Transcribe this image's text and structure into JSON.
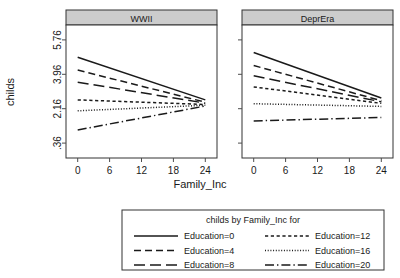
{
  "chart_data": {
    "type": "line",
    "title": "",
    "xlabel": "Family_Inc",
    "ylabel": "childs",
    "xlim": [
      -2.2,
      26.2
    ],
    "ylim": [
      -0.42,
      6.54
    ],
    "xticks": [
      0,
      6,
      12,
      18,
      24
    ],
    "xticklabels": [
      "0",
      "6",
      "12",
      "18",
      "24"
    ],
    "yticks": [
      0.36,
      2.16,
      3.96,
      5.76
    ],
    "yticklabels": [
      ".36",
      "2.16",
      "3.96",
      "5.76"
    ],
    "grid": false,
    "legend_position": "bottom",
    "legend_title": "childs by Family_Inc for",
    "panel_variable": "cohort",
    "panels": [
      {
        "label": "WWII",
        "x": [
          0,
          24
        ],
        "series": [
          {
            "name": "Education=0",
            "linestyle": "solid",
            "values": [
              4.85,
              2.62
            ]
          },
          {
            "name": "Education=4",
            "linestyle": "dashed",
            "values": [
              4.18,
              2.5
            ]
          },
          {
            "name": "Education=8",
            "linestyle": "longdash",
            "values": [
              3.55,
              2.45
            ]
          },
          {
            "name": "Education=12",
            "linestyle": "dotted",
            "values": [
              2.62,
              2.38
            ]
          },
          {
            "name": "Education=16",
            "linestyle": "finedotted",
            "values": [
              2.05,
              2.34
            ]
          },
          {
            "name": "Education=20",
            "linestyle": "dashdot",
            "values": [
              1.05,
              2.3
            ]
          }
        ]
      },
      {
        "label": "DeprEra",
        "x": [
          0,
          24
        ],
        "series": [
          {
            "name": "Education=0",
            "linestyle": "solid",
            "values": [
              5.1,
              2.72
            ]
          },
          {
            "name": "Education=4",
            "linestyle": "dashed",
            "values": [
              4.42,
              2.58
            ]
          },
          {
            "name": "Education=8",
            "linestyle": "longdash",
            "values": [
              3.88,
              2.52
            ]
          },
          {
            "name": "Education=12",
            "linestyle": "dotted",
            "values": [
              3.3,
              2.44
            ]
          },
          {
            "name": "Education=16",
            "linestyle": "finedotted",
            "values": [
              2.42,
              2.28
            ]
          },
          {
            "name": "Education=20",
            "linestyle": "dashdot",
            "values": [
              1.52,
              1.7
            ]
          }
        ]
      }
    ],
    "legend_entries": [
      {
        "label": "Education=0",
        "linestyle": "solid"
      },
      {
        "label": "Education=4",
        "linestyle": "dashed"
      },
      {
        "label": "Education=8",
        "linestyle": "longdash"
      },
      {
        "label": "Education=12",
        "linestyle": "dotted"
      },
      {
        "label": "Education=16",
        "linestyle": "finedotted"
      },
      {
        "label": "Education=20",
        "linestyle": "dashdot"
      }
    ],
    "colors": {
      "line": "#1a1a1a",
      "axis": "#4d4d4d",
      "strip_background": "#cccccc",
      "strip_border": "#333333",
      "panel_background": "#ffffff",
      "text": "#1a1a1a"
    }
  }
}
